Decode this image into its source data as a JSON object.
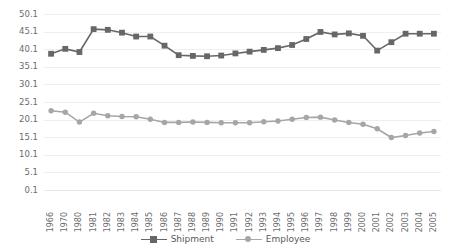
{
  "chart_data": {
    "type": "line",
    "title": "",
    "subtitle": "",
    "xlabel": "",
    "ylabel": "",
    "grid": true,
    "legend_position": "bottom",
    "ylim": [
      0.1,
      50.1
    ],
    "yticks": [
      "0.1",
      "5.1",
      "10.1",
      "15.1",
      "20.1",
      "25.1",
      "30.1",
      "35.1",
      "40.1",
      "45.1",
      "50.1"
    ],
    "ytick_values": [
      0.1,
      5.1,
      10.1,
      15.1,
      20.1,
      25.1,
      30.1,
      35.1,
      40.1,
      45.1,
      50.1
    ],
    "categories": [
      "1966",
      "1970",
      "1980",
      "1981",
      "1982",
      "1983",
      "1984",
      "1985",
      "1986",
      "1987",
      "1988",
      "1989",
      "1990",
      "1991",
      "1992",
      "1993",
      "1994",
      "1995",
      "1996",
      "1997",
      "1998",
      "1999",
      "2000",
      "2001",
      "2002",
      "2003",
      "2004",
      "2005"
    ],
    "series": [
      {
        "name": "Shipment",
        "color": "#676767",
        "marker": "square",
        "values": [
          38.8,
          40.2,
          39.3,
          45.8,
          45.6,
          44.8,
          43.7,
          43.7,
          41.1,
          38.4,
          38.2,
          38.1,
          38.3,
          38.9,
          39.4,
          39.9,
          40.4,
          41.3,
          43.0,
          45.0,
          44.3,
          44.6,
          43.9,
          39.7,
          42.1,
          44.5,
          44.5,
          44.5
        ]
      },
      {
        "name": "Employee",
        "color": "#a6a6a6",
        "marker": "circle",
        "values": [
          22.6,
          22.2,
          19.4,
          21.9,
          21.2,
          21.0,
          20.9,
          20.2,
          19.3,
          19.3,
          19.4,
          19.3,
          19.2,
          19.2,
          19.2,
          19.5,
          19.7,
          20.2,
          20.7,
          20.8,
          20.0,
          19.3,
          18.8,
          17.5,
          15.0,
          15.6,
          16.3,
          16.7
        ]
      }
    ]
  },
  "legend": {
    "items": [
      {
        "label": "Shipment",
        "color": "#676767",
        "marker": "square"
      },
      {
        "label": "Employee",
        "color": "#a6a6a6",
        "marker": "circle"
      }
    ]
  },
  "axis_stub": "1"
}
